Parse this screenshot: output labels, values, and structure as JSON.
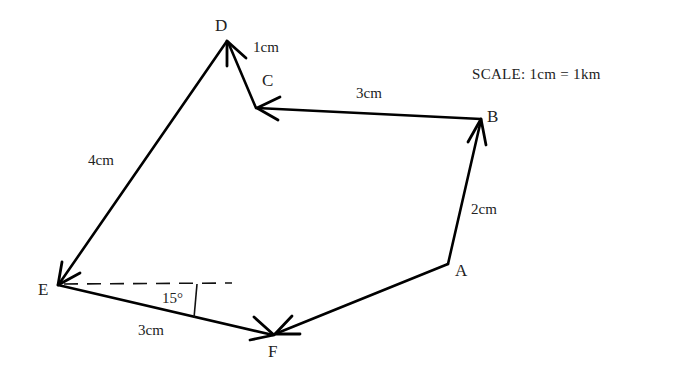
{
  "diagram": {
    "type": "vector-displacement-path",
    "scale_label": "SCALE: 1cm = 1km",
    "points": {
      "A": {
        "label": "A",
        "x": 448,
        "y": 264
      },
      "B": {
        "label": "B",
        "x": 481,
        "y": 119
      },
      "C": {
        "label": "C",
        "x": 256,
        "y": 108
      },
      "D": {
        "label": "D",
        "x": 227,
        "y": 41
      },
      "E": {
        "label": "E",
        "x": 58,
        "y": 285
      },
      "F": {
        "label": "F",
        "x": 274,
        "y": 335
      }
    },
    "segments": [
      {
        "from": "A",
        "to": "B",
        "length_label": "2cm"
      },
      {
        "from": "B",
        "to": "C",
        "length_label": "3cm"
      },
      {
        "from": "C",
        "to": "D",
        "length_label": "1cm"
      },
      {
        "from": "D",
        "to": "E",
        "length_label": "4cm"
      },
      {
        "from": "E",
        "to": "F",
        "length_label": "3cm"
      },
      {
        "from": "A",
        "to": "F",
        "length_label": ""
      }
    ],
    "angle": {
      "at": "E",
      "label": "15°",
      "reference": "horizontal dashed line"
    }
  }
}
